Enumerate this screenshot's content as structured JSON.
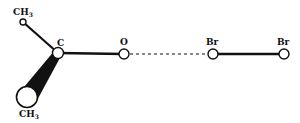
{
  "diagram": {
    "type": "molecular-structure",
    "atoms": {
      "ch3_top": {
        "label": "CH",
        "sub": "3"
      },
      "c": {
        "label": "C"
      },
      "o": {
        "label": "O"
      },
      "br1": {
        "label": "Br"
      },
      "br2": {
        "label": "Br"
      },
      "ch3_bottom": {
        "label": "CH",
        "sub": "3"
      }
    },
    "bonds": [
      {
        "from": "ch3_top",
        "to": "c",
        "style": "solid"
      },
      {
        "from": "c",
        "to": "ch3_bottom",
        "style": "wedge"
      },
      {
        "from": "c",
        "to": "o",
        "style": "solid"
      },
      {
        "from": "o",
        "to": "br1",
        "style": "dashed"
      },
      {
        "from": "br1",
        "to": "br2",
        "style": "solid"
      }
    ]
  }
}
